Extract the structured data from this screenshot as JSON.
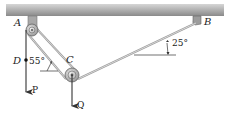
{
  "diagram": {
    "type": "statics-pulley-system",
    "points": {
      "A": {
        "label": "A"
      },
      "B": {
        "label": "B"
      },
      "C": {
        "label": "C"
      },
      "D": {
        "label": "D"
      }
    },
    "forces": {
      "P": {
        "label": "P"
      },
      "Q": {
        "label": "Q"
      }
    },
    "angles": {
      "at_D": {
        "label": "55°"
      },
      "at_B": {
        "label": "25°"
      }
    },
    "colors": {
      "beam_top": "#c8c8c8",
      "beam_bottom": "#8f8f8f",
      "cable": "#a0a0a0",
      "ink": "#222222"
    }
  }
}
